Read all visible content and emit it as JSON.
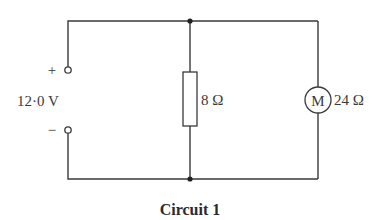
{
  "diagram": {
    "type": "circuit",
    "caption": "Circuit 1",
    "supply": {
      "voltage_label": "12·0 V",
      "positive_label": "+",
      "negative_label": "−"
    },
    "resistor": {
      "label": "8 Ω",
      "resistance_ohms": 8
    },
    "motor": {
      "symbol": "M",
      "label": "24 Ω",
      "resistance_ohms": 24
    },
    "configuration": "resistor and motor connected in parallel across supply",
    "colors": {
      "line": "#3a3a3a",
      "background": "#ffffff"
    }
  }
}
